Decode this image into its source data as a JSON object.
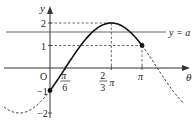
{
  "diagram": {
    "type": "function-graph",
    "function": "y = 2 sin(θ − π/6)",
    "axes": {
      "x_label": "θ",
      "y_label": "y",
      "origin_label": "O"
    },
    "y_ticks": [
      {
        "value": 2,
        "label": "2"
      },
      {
        "value": 1,
        "label": "1"
      },
      {
        "value": -1,
        "label": "-1"
      },
      {
        "value": -2,
        "label": "-2"
      }
    ],
    "x_ticks": [
      {
        "value_pi": 0.16667,
        "num": "π",
        "den": "6"
      },
      {
        "value_pi": 0.66667,
        "num": "2",
        "den": "3",
        "suffix": "π"
      },
      {
        "value_pi": 1.0,
        "label": "π"
      }
    ],
    "line_label": "y = a",
    "line_a_value": 1.6,
    "solid_domain_pi": [
      0,
      1
    ],
    "dashed_domain_pi": [
      [
        -0.5,
        0
      ],
      [
        1,
        1.45
      ]
    ],
    "points": [
      {
        "theta_pi": 0,
        "y": -1
      },
      {
        "theta_pi": 1,
        "y": 1
      }
    ]
  }
}
